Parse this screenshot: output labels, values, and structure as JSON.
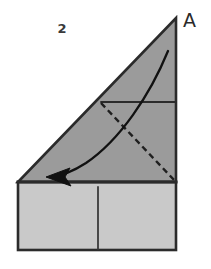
{
  "figure": {
    "step_number": "2",
    "corner_label": "A",
    "background_color": "#ffffff",
    "outline_color": "#2b2b2b",
    "upper_flap_fill": "#9b9b9b",
    "lower_panel_fill": "#c9c9c9",
    "crease_line_color": "#2b2b2b",
    "dashed_line_color": "#1f1f1f",
    "arrow_color": "#111111"
  },
  "shapes": {
    "upper_triangle": {
      "name": "upper-triangle-flap",
      "points": "18,182 176,182 176,18",
      "fill": "#9b9b9b"
    },
    "lower_rectangle": {
      "name": "lower-rectangle-panel",
      "x": 18,
      "y": 182,
      "width": 158,
      "height": 68,
      "fill": "#c9c9c9"
    },
    "horizontal_crease": {
      "name": "horizontal-crease-line",
      "x1": 101,
      "y1": 102,
      "x2": 176,
      "y2": 102
    },
    "vertical_divider": {
      "name": "vertical-divider-line",
      "x1": 98,
      "y1": 187,
      "x2": 98,
      "y2": 249
    },
    "dashed_fold_line": {
      "name": "dashed-fold-line",
      "x1": 101,
      "y1": 103,
      "x2": 175,
      "y2": 181,
      "dash_pattern": "6,4"
    },
    "fold_arrow": {
      "name": "fold-direction-arrow",
      "path": "M 168,51 C 150,95 120,140 86,163 C 72,172 60,176 49,177",
      "arrowhead": "50,177 67,170 64,178 70,185"
    }
  },
  "labels": {
    "step": {
      "text": "2",
      "x": 62,
      "y": 33
    },
    "corner": {
      "text": "A",
      "x": 183,
      "y": 27
    }
  }
}
